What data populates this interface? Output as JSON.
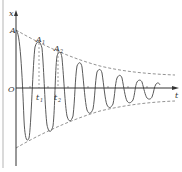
{
  "figure": {
    "axes": {
      "y_label": "x",
      "x_label": "t",
      "origin_label": "O"
    },
    "labels": {
      "amplitude": "A",
      "peak1": "A",
      "peak1_sub": "1",
      "peak2": "A",
      "peak2_sub": "2",
      "time1": "t",
      "time1_sub": "1",
      "time2": "t",
      "time2_sub": "2"
    },
    "colors": {
      "curve": "#555555",
      "axis": "#333333",
      "envelope": "#666666",
      "border": "#aaaaaa"
    }
  }
}
